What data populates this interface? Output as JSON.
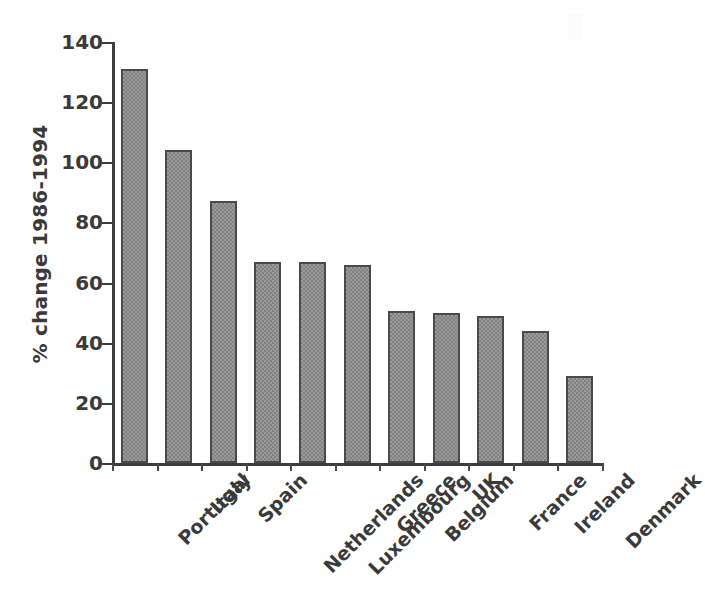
{
  "chart_data": {
    "type": "bar",
    "title": "",
    "xlabel": "",
    "ylabel": "% change 1986-1994",
    "ylim": [
      0,
      140
    ],
    "yticks": [
      0,
      20,
      40,
      60,
      80,
      100,
      120,
      140
    ],
    "ytick_labels": [
      "0",
      "20",
      "40",
      "60",
      "80",
      "100",
      "120",
      "140"
    ],
    "grid": false,
    "legend": null,
    "orientation": "vertical",
    "categories": [
      "Portugal",
      "Italy",
      "Spain",
      "Netherlands",
      "Luxembourg",
      "Greece",
      "Belgium",
      "UK",
      "France",
      "Ireland",
      "Denmark"
    ],
    "values": [
      131,
      104,
      87,
      67,
      67,
      66,
      50.5,
      50,
      49,
      44,
      29
    ],
    "bar_color": "#9a9a9a",
    "bar_edge_color": "#4a4a4a",
    "axis_color": "#3d3d3d",
    "text_color": "#3a3a3a",
    "background": "#ffffff"
  }
}
